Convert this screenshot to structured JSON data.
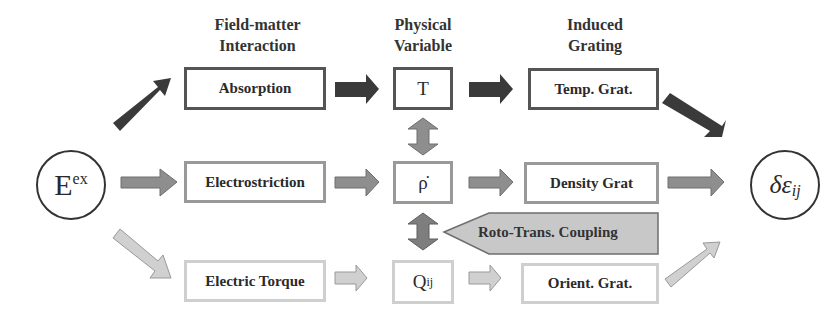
{
  "headers": {
    "interaction": [
      "Field-matter",
      "Interaction"
    ],
    "variable": [
      "Physical",
      "Variable"
    ],
    "grating": [
      "Induced",
      "Grating"
    ]
  },
  "source": {
    "base": "E",
    "sup": "ex"
  },
  "target": {
    "base": "δε",
    "sub": "ij"
  },
  "rows": [
    {
      "interaction": "Absorption",
      "variable": "T",
      "grating": "Temp. Grat.",
      "tone": "dark"
    },
    {
      "interaction": "Electrostriction",
      "variable": "ρ̇",
      "grating": "Density Grat",
      "tone": "mid"
    },
    {
      "interaction": "Electric Torque",
      "variable_base": "Q",
      "variable_sub": "ij",
      "grating": "Orient. Grat.",
      "tone": "light"
    }
  ],
  "coupling": {
    "label": "Roto-Trans. Coupling"
  },
  "colors": {
    "dark": "#333333",
    "mid": "#999999",
    "light": "#d0d0d0"
  }
}
